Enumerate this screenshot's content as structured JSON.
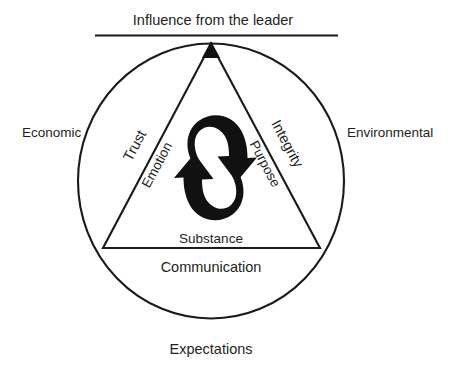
{
  "diagram": {
    "colors": {
      "stroke": "#1a1a1a",
      "text": "#231f20",
      "background": "#ffffff",
      "arrow": "#111111"
    },
    "outer_labels": {
      "top": "Influence from the leader",
      "left": "Economic",
      "right": "Environmental",
      "bottom": "Expectations",
      "below_base": "Communication"
    },
    "triangle_edge_labels": {
      "left_outer": "Trust",
      "left_inner": "Emotion",
      "right_outer": "Integrity",
      "right_inner": "Purpose",
      "base_inner": "Substance"
    },
    "center": {
      "cycle_icon": "circular-cycle-arrows",
      "arrow_count": 2
    },
    "geometry": {
      "circle_center_x": 211,
      "circle_center_y": 181,
      "circle_radius_x": 134,
      "circle_radius_y": 138,
      "triangle_apex_x": 211,
      "triangle_apex_y": 44,
      "triangle_base_y": 248,
      "triangle_left_x": 103,
      "triangle_right_x": 320,
      "top_rule_y": 35,
      "top_rule_x1": 95,
      "top_rule_x2": 338
    }
  }
}
